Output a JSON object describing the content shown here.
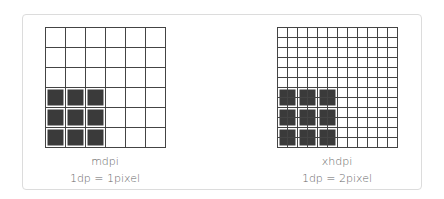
{
  "panels": [
    {
      "id": "mdpi",
      "density_label": "mdpi",
      "ratio_label": "1dp = 1pixel",
      "grid_cells": 6,
      "cell_px": 20,
      "filled_rows": [
        3,
        4,
        5
      ],
      "filled_cols": [
        0,
        1,
        2
      ],
      "filled_span": 1
    },
    {
      "id": "xhdpi",
      "density_label": "xhdpi",
      "ratio_label": "1dp = 2pixel",
      "grid_cells": 12,
      "cell_px": 10,
      "filled_rows": [
        3,
        4,
        5
      ],
      "filled_cols": [
        0,
        1,
        2
      ],
      "filled_span": 2
    }
  ],
  "colors": {
    "grid_line": "#444444",
    "fill": "#3a3a3a",
    "border": "#dcdcdc",
    "text": "#666666"
  }
}
